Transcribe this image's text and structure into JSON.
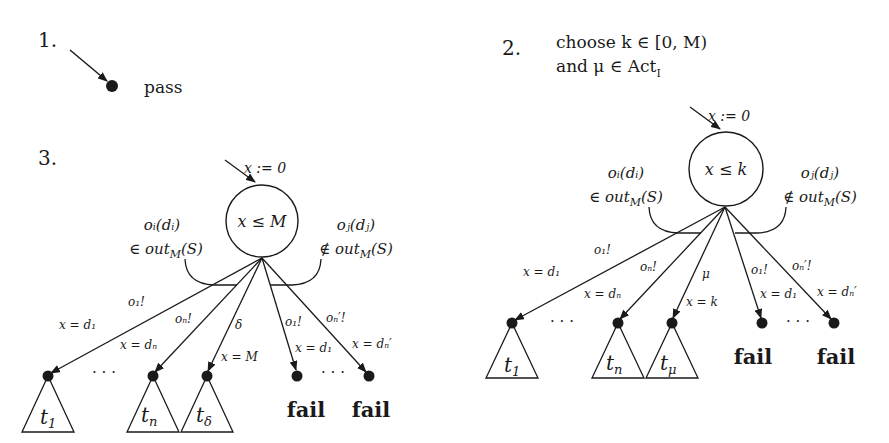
{
  "figure": {
    "part1": {
      "number": "1.",
      "state_label": "pass"
    },
    "part2": {
      "number": "2.",
      "line1": "choose k ∈ [0, M)",
      "line2": "and μ ∈ Act",
      "line2_sub": "I",
      "init": "x := 0",
      "invariant": "x ≤ k",
      "left_group": {
        "line1": "oᵢ(dᵢ)",
        "line2": "∈ out",
        "sub": "M",
        "tail": "(S)"
      },
      "right_group": {
        "line1": "oⱼ(dⱼ)",
        "line2": "∉ out",
        "sub": "M",
        "tail": "(S)"
      },
      "edges": [
        {
          "action": "o₁!",
          "guard": "x = d₁"
        },
        {
          "action": "oₙ!",
          "guard": "x = dₙ"
        },
        {
          "action": "μ",
          "guard": "x = k"
        },
        {
          "action": "o₁!",
          "guard": "x = d₁"
        },
        {
          "action": "oₙ′!",
          "guard": "x = dₙ′"
        }
      ],
      "leaves": [
        "t",
        "t",
        "t",
        "fail",
        "fail"
      ],
      "leaf_subs": [
        "1",
        "n",
        "μ"
      ],
      "ellipsis": "· · ·"
    },
    "part3": {
      "number": "3.",
      "init": "x := 0",
      "invariant": "x ≤ M",
      "left_group": {
        "line1": "oᵢ(dᵢ)",
        "line2": "∈ out",
        "sub": "M",
        "tail": "(S)"
      },
      "right_group": {
        "line1": "oⱼ(dⱼ)",
        "line2": "∉ out",
        "sub": "M",
        "tail": "(S)"
      },
      "edges": [
        {
          "action": "o₁!",
          "guard": "x = d₁"
        },
        {
          "action": "oₙ!",
          "guard": "x = dₙ"
        },
        {
          "action": "δ",
          "guard": "x = M"
        },
        {
          "action": "o₁!",
          "guard": "x = d₁"
        },
        {
          "action": "oₙ′!",
          "guard": "x = dₙ′"
        }
      ],
      "leaves": [
        "t",
        "t",
        "t",
        "fail",
        "fail"
      ],
      "leaf_subs": [
        "1",
        "n",
        "δ"
      ],
      "ellipsis": "· · ·"
    }
  }
}
